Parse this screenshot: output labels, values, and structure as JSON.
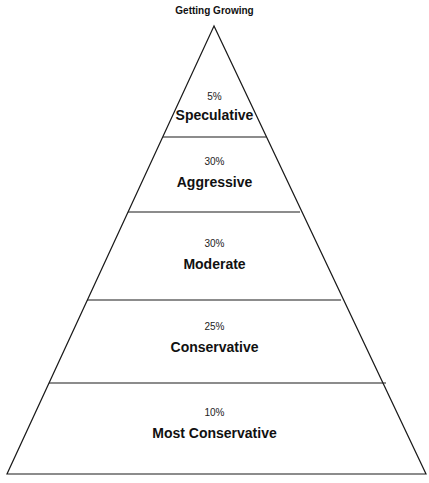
{
  "title": "Getting Growing",
  "tiers": [
    {
      "percent": "5%",
      "label": "Speculative"
    },
    {
      "percent": "30%",
      "label": "Aggressive"
    },
    {
      "percent": "30%",
      "label": "Moderate"
    },
    {
      "percent": "25%",
      "label": "Conservative"
    },
    {
      "percent": "10%",
      "label": "Most Conservative"
    }
  ],
  "colors": {
    "stroke": "#1a1a1a",
    "fill": "#ffffff"
  }
}
